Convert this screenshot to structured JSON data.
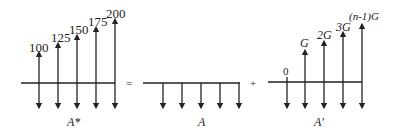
{
  "diagram": {
    "left": {
      "label": "A*",
      "values": [
        "100",
        "125",
        "150",
        "175",
        "200"
      ]
    },
    "operator_equals": "=",
    "middle": {
      "label": "A"
    },
    "operator_plus": "+",
    "right": {
      "label": "A'",
      "values": [
        "0",
        "G",
        "2G",
        "3G",
        "(n-1)G"
      ]
    }
  }
}
